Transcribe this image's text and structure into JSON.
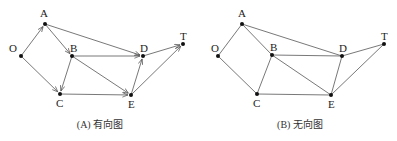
{
  "graphs": [
    {
      "caption": "(A) 有向图",
      "directed": true,
      "nodes": [
        {
          "id": "O",
          "x": 21,
          "y": 56,
          "lx": 9,
          "ly": 52
        },
        {
          "id": "A",
          "x": 45,
          "y": 24,
          "lx": 40,
          "ly": 17
        },
        {
          "id": "B",
          "x": 72,
          "y": 56,
          "lx": 70,
          "ly": 52
        },
        {
          "id": "D",
          "x": 143,
          "y": 56,
          "lx": 140,
          "ly": 52
        },
        {
          "id": "T",
          "x": 183,
          "y": 44,
          "lx": 180,
          "ly": 40
        },
        {
          "id": "C",
          "x": 60,
          "y": 94,
          "lx": 56,
          "ly": 107
        },
        {
          "id": "E",
          "x": 131,
          "y": 95,
          "lx": 128,
          "ly": 108
        }
      ],
      "edges": [
        [
          "O",
          "A"
        ],
        [
          "O",
          "C"
        ],
        [
          "A",
          "B"
        ],
        [
          "A",
          "D"
        ],
        [
          "B",
          "D"
        ],
        [
          "B",
          "E"
        ],
        [
          "B",
          "C"
        ],
        [
          "C",
          "E"
        ],
        [
          "E",
          "D"
        ],
        [
          "E",
          "T"
        ],
        [
          "D",
          "T"
        ]
      ],
      "caption_x": 100,
      "caption_y": 128
    },
    {
      "caption": "(B) 无向图",
      "directed": false,
      "nodes": [
        {
          "id": "O",
          "x": 218,
          "y": 56,
          "lx": 211,
          "ly": 52
        },
        {
          "id": "A",
          "x": 242,
          "y": 24,
          "lx": 238,
          "ly": 17
        },
        {
          "id": "B",
          "x": 272,
          "y": 55,
          "lx": 270,
          "ly": 51
        },
        {
          "id": "D",
          "x": 342,
          "y": 56,
          "lx": 339,
          "ly": 52
        },
        {
          "id": "T",
          "x": 384,
          "y": 44,
          "lx": 381,
          "ly": 40
        },
        {
          "id": "C",
          "x": 257,
          "y": 94,
          "lx": 253,
          "ly": 107
        },
        {
          "id": "E",
          "x": 331,
          "y": 95,
          "lx": 328,
          "ly": 108
        }
      ],
      "edges": [
        [
          "O",
          "A"
        ],
        [
          "O",
          "C"
        ],
        [
          "A",
          "B"
        ],
        [
          "A",
          "D"
        ],
        [
          "B",
          "D"
        ],
        [
          "B",
          "E"
        ],
        [
          "B",
          "C"
        ],
        [
          "C",
          "E"
        ],
        [
          "E",
          "D"
        ],
        [
          "E",
          "T"
        ],
        [
          "D",
          "T"
        ]
      ],
      "caption_x": 300,
      "caption_y": 128
    }
  ]
}
